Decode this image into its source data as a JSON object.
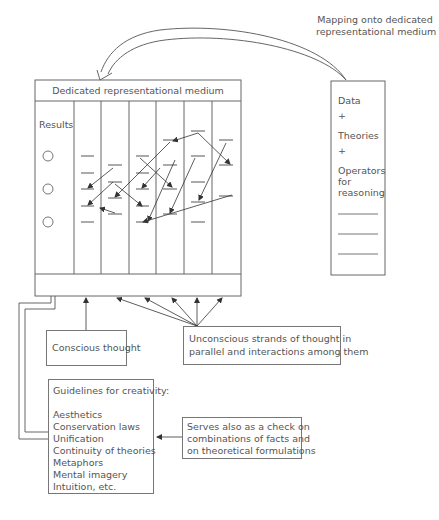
{
  "mapping_label": {
    "line1": "Mapping onto dedicated",
    "line2": "representational medium"
  },
  "main_box": {
    "title": "Dedicated representational medium",
    "results_label": "Results",
    "result_circles": 3,
    "columns": 6
  },
  "input_box": {
    "items": [
      "Data",
      "+",
      "Theories",
      "+",
      "Operators",
      "for",
      "reasoning"
    ],
    "blank_lines": 3
  },
  "conscious_box": {
    "label": "Conscious thought"
  },
  "unconscious_box": {
    "line1": "Unconscious strands of thought in",
    "line2": "parallel and interactions among them"
  },
  "guidelines_box": {
    "title": "Guidelines for creativity:",
    "items": [
      "Aesthetics",
      "Conservation laws",
      "Unification",
      "Continuity of theories",
      "Metaphors",
      "Mental imagery",
      "Intuition, etc."
    ]
  },
  "serves_box": {
    "line1": "Serves also as a check on",
    "line2": "combinations of facts and",
    "line3": "on theoretical formulations"
  },
  "colors": {
    "line": "#555555",
    "text": "#555555",
    "background": "#ffffff"
  }
}
